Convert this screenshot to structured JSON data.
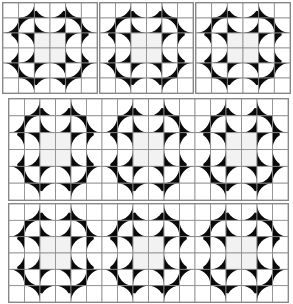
{
  "colors": {
    "dark": "#0a0a0a",
    "light": "#ffffff",
    "grid": "#8a8a8a",
    "center": "#f2f2f2"
  },
  "panels": [
    {
      "id": "block-1",
      "x": 2,
      "y": 2,
      "w": 96,
      "h": 92,
      "cols": 6,
      "rows": 6,
      "kind": "single"
    },
    {
      "id": "block-2",
      "x": 99,
      "y": 2,
      "w": 95,
      "h": 92,
      "cols": 6,
      "rows": 6,
      "kind": "single"
    },
    {
      "id": "block-3",
      "x": 195,
      "y": 2,
      "w": 96,
      "h": 92,
      "cols": 6,
      "rows": 6,
      "kind": "single"
    },
    {
      "id": "strip-1",
      "x": 8,
      "y": 98,
      "w": 281,
      "h": 103,
      "cols": 18,
      "rows": 6,
      "kind": "strip"
    },
    {
      "id": "strip-2",
      "x": 8,
      "y": 203,
      "w": 281,
      "h": 100,
      "cols": 18,
      "rows": 6,
      "kind": "strip"
    }
  ]
}
